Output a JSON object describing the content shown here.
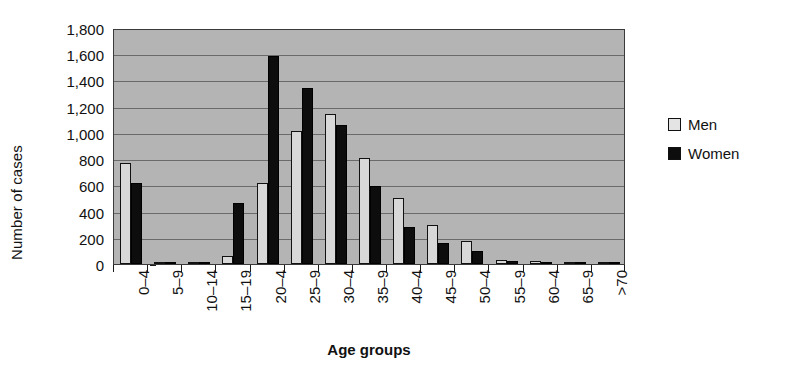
{
  "chart_data": {
    "type": "bar",
    "title": "",
    "xlabel": "Age groups",
    "ylabel": "Number of cases",
    "ylim": [
      0,
      1800
    ],
    "yticks": [
      0,
      200,
      400,
      600,
      800,
      1000,
      1200,
      1400,
      1600,
      1800
    ],
    "ytick_labels": [
      "0",
      "200",
      "400",
      "600",
      "800",
      "1,000",
      "1,200",
      "1,400",
      "1,600",
      "1,800"
    ],
    "grid": true,
    "legend_position": "right",
    "categories": [
      "0–4",
      "5–9",
      "10–14",
      "15–19",
      "20–4",
      "25–9",
      "30–4",
      "35–9",
      "40–4",
      "45–9",
      "50–4",
      "55–9",
      "60–4",
      "65–9",
      ">70"
    ],
    "series": [
      {
        "name": "Men",
        "color": "#d8d8d8",
        "values": [
          770,
          10,
          8,
          60,
          620,
          1015,
          1145,
          805,
          500,
          300,
          175,
          30,
          20,
          8,
          5
        ]
      },
      {
        "name": "Women",
        "color": "#0d0d0d",
        "values": [
          615,
          12,
          10,
          465,
          1590,
          1340,
          1060,
          595,
          285,
          160,
          100,
          20,
          10,
          8,
          10
        ]
      }
    ]
  },
  "legend": {
    "items": [
      {
        "label": "Men",
        "swatch": "men-swatch"
      },
      {
        "label": "Women",
        "swatch": "women-swatch"
      }
    ]
  },
  "axes": {
    "y_title": "Number of cases",
    "x_title": "Age groups"
  }
}
